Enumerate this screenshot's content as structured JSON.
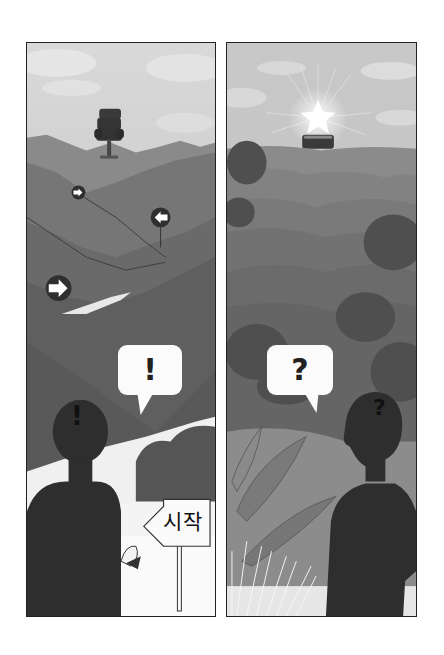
{
  "panels": [
    {
      "id": "left",
      "description": "Winding mountain path with direction arrows leading to an office chair on a hilltop",
      "speech_bubble": "!",
      "head_mark": "!",
      "sign_text": "시작",
      "elements": [
        "office-chair",
        "arrow-right-small",
        "arrow-left",
        "arrow-right-large",
        "winding-path",
        "sign-post",
        "rolled-diploma",
        "silhouette-person"
      ]
    },
    {
      "id": "right",
      "description": "Hazy forested hills with a glowing star above a treasure chest on the horizon",
      "speech_bubble": "?",
      "head_mark": "?",
      "elements": [
        "shining-star",
        "treasure-chest",
        "rolling-hills",
        "trees",
        "banana-leaves",
        "tall-grass",
        "silhouette-person-profile"
      ]
    }
  ],
  "colors": {
    "border": "#222222",
    "sky": "#bdbdbd",
    "hills_dark": "#5e5e5e",
    "hills_mid": "#7a7a7a",
    "silhouette": "#2e2e2e",
    "bubble": "#fbfbfb",
    "path": "#efefef"
  }
}
